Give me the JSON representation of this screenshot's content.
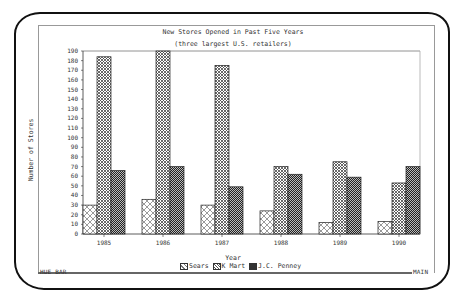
{
  "status_bar": {
    "left_label": "HUE BAR",
    "right_label": "MAIN"
  },
  "chart_data": {
    "type": "bar",
    "title": "New Stores Opened in Past Five Years",
    "subtitle": "(three largest U.S. retailers)",
    "xlabel": "Year",
    "ylabel": "Number of Stores",
    "ylim": [
      0,
      190
    ],
    "yticks": [
      0,
      10,
      20,
      30,
      40,
      50,
      60,
      70,
      80,
      90,
      100,
      110,
      120,
      130,
      140,
      150,
      160,
      170,
      180,
      190
    ],
    "categories": [
      "1985",
      "1986",
      "1987",
      "1988",
      "1989",
      "1990"
    ],
    "series": [
      {
        "name": "Sears",
        "pattern": "light-crosshatch",
        "values": [
          30,
          36,
          30,
          24,
          12,
          13
        ]
      },
      {
        "name": "K Mart",
        "pattern": "medium-crosshatch",
        "values": [
          184,
          190,
          175,
          70,
          75,
          53
        ]
      },
      {
        "name": "J.C. Penney",
        "pattern": "dark-crosshatch",
        "values": [
          66,
          70,
          49,
          62,
          59,
          70
        ]
      }
    ],
    "legend_position": "bottom",
    "grid": false
  }
}
